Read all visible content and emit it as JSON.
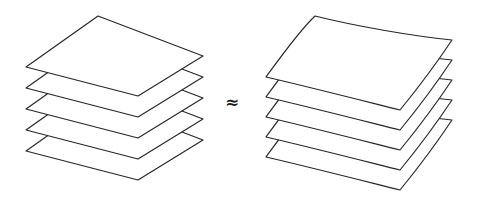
{
  "figure": {
    "background_color": "#ffffff",
    "stroke_color": "#262626",
    "fill_color": "#ffffff",
    "width": 477,
    "height": 209
  },
  "relation": {
    "symbol": "≈",
    "name": "approximately-equal",
    "x": 232,
    "y": 102
  },
  "left_stack": {
    "label": "flat-sheet-stack",
    "shape": "flat-parallelogram-planes",
    "sheet_count": 5,
    "layer_spacing_px": 21,
    "top_sheet_corners": {
      "top": [
        98,
        16
      ],
      "right": [
        203,
        56
      ],
      "bottom": [
        138,
        96
      ],
      "left": [
        26,
        67
      ]
    },
    "sheets": [
      {
        "index": 1,
        "offset_y": 0,
        "name": "flat-sheet-1-top"
      },
      {
        "index": 2,
        "offset_y": 21,
        "name": "flat-sheet-2"
      },
      {
        "index": 3,
        "offset_y": 42,
        "name": "flat-sheet-3"
      },
      {
        "index": 4,
        "offset_y": 63,
        "name": "flat-sheet-4"
      },
      {
        "index": 5,
        "offset_y": 84,
        "name": "flat-sheet-5-bottom"
      }
    ]
  },
  "right_stack": {
    "label": "curved-sheet-stack",
    "shape": "warped-saddle-surfaces",
    "sheet_count": 5,
    "layer_spacing_px": 20,
    "top_sheet_corners": {
      "top": [
        315,
        16
      ],
      "right": [
        452,
        40
      ],
      "bottom": [
        400,
        110
      ],
      "left": [
        266,
        77
      ]
    },
    "sheets": [
      {
        "index": 1,
        "offset_y": 0,
        "name": "curved-sheet-1-top"
      },
      {
        "index": 2,
        "offset_y": 20,
        "name": "curved-sheet-2"
      },
      {
        "index": 3,
        "offset_y": 40,
        "name": "curved-sheet-3"
      },
      {
        "index": 4,
        "offset_y": 60,
        "name": "curved-sheet-4"
      },
      {
        "index": 5,
        "offset_y": 80,
        "name": "curved-sheet-5-bottom"
      }
    ]
  }
}
